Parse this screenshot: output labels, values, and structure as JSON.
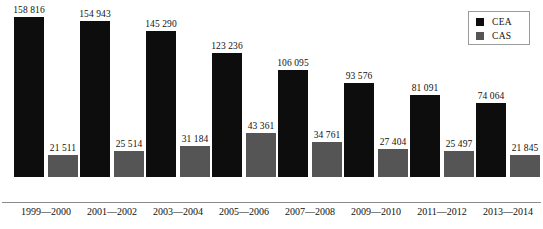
{
  "chart_data": {
    "type": "bar",
    "title": "",
    "xlabel": "",
    "ylabel": "",
    "grid": false,
    "legend_position": "top-right",
    "ylim": [
      0,
      176000
    ],
    "categories": [
      "1999—2000",
      "2001—2002",
      "2003—2004",
      "2005—2006",
      "2007—2008",
      "2009—2010",
      "2011—2012",
      "2013—2014"
    ],
    "series": [
      {
        "name": "CEA",
        "color": "#0d0d0d",
        "values": [
          158816,
          154943,
          145290,
          123236,
          106095,
          93576,
          81091,
          74064
        ],
        "labels": [
          "158 816",
          "154 943",
          "145 290",
          "123 236",
          "106 095",
          "93 576",
          "81 091",
          "74 064"
        ]
      },
      {
        "name": "CAS",
        "color": "#555555",
        "values": [
          21511,
          25514,
          31184,
          43361,
          34761,
          27404,
          25497,
          21845
        ],
        "labels": [
          "21 511",
          "25 514",
          "31 184",
          "43 361",
          "34 761",
          "27 404",
          "25 497",
          "21 845"
        ]
      }
    ]
  },
  "legend": {
    "items": [
      {
        "label": "CEA",
        "color": "#0d0d0d"
      },
      {
        "label": "CAS",
        "color": "#555555"
      }
    ]
  }
}
